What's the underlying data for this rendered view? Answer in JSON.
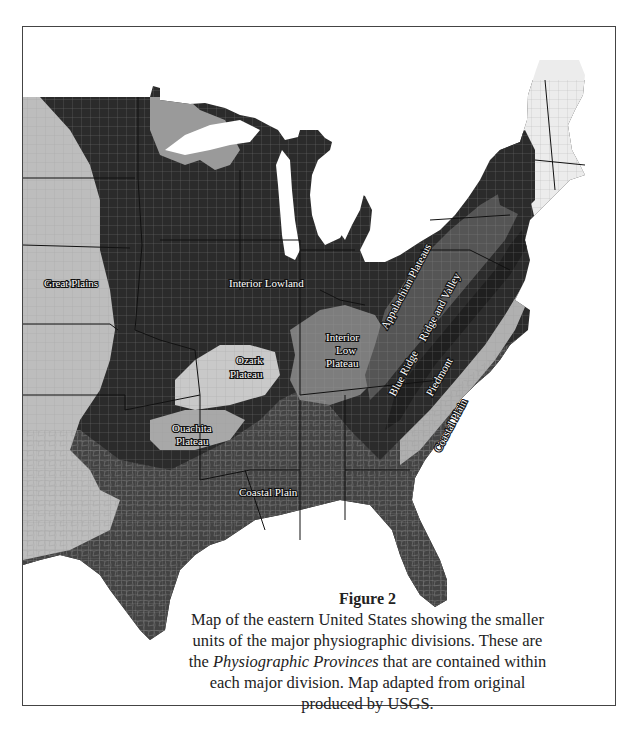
{
  "figure": {
    "title": "Figure 2",
    "caption_parts": {
      "before_italic": "Map of the eastern United States showing the smaller units of the major physiographic divisions. These are the ",
      "italic": "Physiographic Provinces",
      "after_italic": " that are contained within each major division. Map adapted from original produced by USGS."
    }
  },
  "map": {
    "colors": {
      "background": "#ffffff",
      "interior_lowland": "#2b2b2b",
      "great_plains": "#bdbdbd",
      "ozark_plateau": "#c9c9c9",
      "ouachita_plateau": "#a8a8a8",
      "coastal_plain": "#434343",
      "interior_low_plateau": "#7d7d7d",
      "appalachian_plateaus": "#555555",
      "ridge_and_valley": "#1f1f1f",
      "blue_ridge": "#262626",
      "piedmont": "#b0b0b0",
      "new_england": "#ececec",
      "superior_upland": "#9a9a9a",
      "county_lines": "#9a9a9a",
      "state_lines": "#111111"
    },
    "labels": [
      {
        "id": "great-plains",
        "text": "Great Plains",
        "x": 44,
        "y": 287,
        "rotate": 0
      },
      {
        "id": "interior-lowland",
        "text": "Interior Lowland",
        "x": 229,
        "y": 287,
        "rotate": 0
      },
      {
        "id": "ozark-plateau-1",
        "text": "Ozark",
        "x": 236,
        "y": 364,
        "rotate": 0
      },
      {
        "id": "ozark-plateau-2",
        "text": "Plateau",
        "x": 230,
        "y": 378,
        "rotate": 0
      },
      {
        "id": "interior-low-plateau-1",
        "text": "Interior",
        "x": 326,
        "y": 341,
        "rotate": 0
      },
      {
        "id": "interior-low-plateau-2",
        "text": "Low",
        "x": 336,
        "y": 354,
        "rotate": 0
      },
      {
        "id": "interior-low-plateau-3",
        "text": "Plateau",
        "x": 326,
        "y": 367,
        "rotate": 0
      },
      {
        "id": "ouachita-plateau-1",
        "text": "Ouachita",
        "x": 172,
        "y": 432,
        "rotate": 0
      },
      {
        "id": "ouachita-plateau-2",
        "text": "Plateau",
        "x": 176,
        "y": 445,
        "rotate": 0
      },
      {
        "id": "coastal-plain-west",
        "text": "Coastal Plain",
        "x": 239,
        "y": 496,
        "rotate": 0
      },
      {
        "id": "appalachian-plateaus",
        "text": "Appalachian Plateaus",
        "x": 387,
        "y": 330,
        "rotate": -62
      },
      {
        "id": "ridge-and-valley",
        "text": "Ridge and Valley",
        "x": 425,
        "y": 342,
        "rotate": -62
      },
      {
        "id": "blue-ridge",
        "text": "Blue Ridge",
        "x": 395,
        "y": 397,
        "rotate": -62
      },
      {
        "id": "piedmont",
        "text": "Piedmont",
        "x": 432,
        "y": 397,
        "rotate": -60
      },
      {
        "id": "coastal-plain-east",
        "text": "Coastal Plain",
        "x": 440,
        "y": 453,
        "rotate": -62
      }
    ]
  }
}
